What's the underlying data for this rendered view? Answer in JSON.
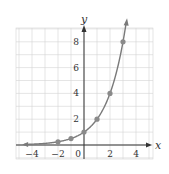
{
  "chart_data": {
    "type": "line",
    "title": "",
    "xlabel": "x",
    "ylabel": "y",
    "xlim": [
      -5.2,
      5.3
    ],
    "ylim": [
      -1.1,
      9.1
    ],
    "grid": true,
    "x_ticks": [
      -4,
      -2,
      0,
      2,
      4
    ],
    "x_tick_labels": [
      "−4",
      "−2",
      "0",
      "2",
      "4"
    ],
    "y_ticks": [
      2,
      4,
      6,
      8
    ],
    "y_tick_labels": [
      "2",
      "4",
      "6",
      "8"
    ],
    "series": [
      {
        "name": "y = 2^x",
        "curve_x_range": [
          -4.6,
          3.25
        ],
        "points": [
          {
            "x": -2,
            "y": 0.25
          },
          {
            "x": -1,
            "y": 0.5
          },
          {
            "x": 0,
            "y": 1
          },
          {
            "x": 1,
            "y": 2
          },
          {
            "x": 2,
            "y": 4
          },
          {
            "x": 3,
            "y": 8
          }
        ]
      }
    ],
    "colors": {
      "curve": "#7a7a7a",
      "points": "#8a8a8a",
      "grid": "#d4d4d4",
      "axis": "#333333"
    }
  }
}
